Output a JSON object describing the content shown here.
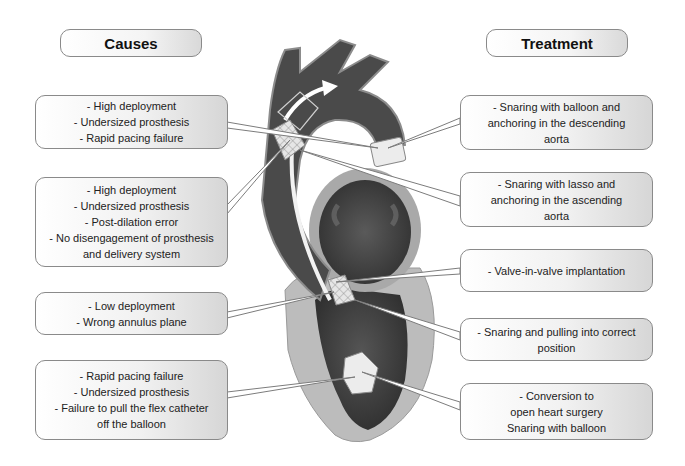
{
  "headers": {
    "causes": "Causes",
    "treatment": "Treatment"
  },
  "causes": [
    {
      "lines": [
        "- High deployment",
        "- Undersized prosthesis",
        "- Rapid pacing failure"
      ]
    },
    {
      "lines": [
        "- High deployment",
        "- Undersized prosthesis",
        "- Post-dilation error",
        "- No disengagement of prosthesis",
        "and delivery system"
      ]
    },
    {
      "lines": [
        "- Low deployment",
        "- Wrong annulus plane"
      ]
    },
    {
      "lines": [
        "- Rapid pacing failure",
        "- Undersized prosthesis",
        "- Failure to pull the flex catheter",
        "off the balloon"
      ]
    }
  ],
  "treatments": [
    {
      "lines": [
        "- Snaring with balloon and",
        "anchoring in the descending",
        "aorta"
      ]
    },
    {
      "lines": [
        "- Snaring with lasso and",
        "anchoring in the ascending",
        "aorta"
      ]
    },
    {
      "lines": [
        "- Valve-in-valve implantation"
      ]
    },
    {
      "lines": [
        "- Snaring and pulling into correct",
        "position"
      ]
    },
    {
      "lines": [
        "- Conversion to",
        "open heart surgery",
        "Snaring with balloon"
      ]
    }
  ],
  "illustration": {
    "subject": "heart cross-section with aorta, catheter and displaced transcatheter valve prostheses",
    "colors": {
      "aorta_wall": "#4a4a4a",
      "ventricle_cavity": "#3a3a3a",
      "myocardium": "#bdbdbd",
      "prosthesis": "#e8e8e8",
      "catheter": "#f5f5f5"
    }
  }
}
